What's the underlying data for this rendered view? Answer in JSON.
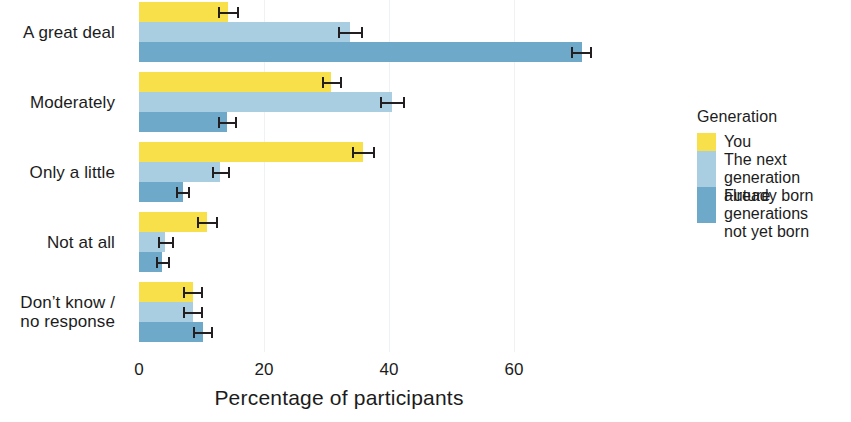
{
  "chart_data": {
    "type": "bar",
    "orientation": "horizontal",
    "title": "",
    "xlabel": "Percentage of participants",
    "ylabel": "",
    "xlim": [
      0,
      78
    ],
    "xticks": [
      0,
      20,
      40,
      60
    ],
    "xtick_labels": [
      "0",
      "20",
      "40",
      "60"
    ],
    "grid": true,
    "legend_position": "right",
    "legend_title": "Generation",
    "categories": [
      "A great deal",
      "Moderately",
      "Only a little",
      "Not at all",
      "Don’t know /\nno response"
    ],
    "series": [
      {
        "name": "You",
        "color": "#f7e04a",
        "values": [
          14.2,
          30.7,
          35.8,
          10.9,
          8.6
        ],
        "err_low": [
          12.6,
          29.3,
          34.0,
          9.2,
          7.1
        ],
        "err_high": [
          16.0,
          32.5,
          37.7,
          12.6,
          10.3
        ]
      },
      {
        "name": "The next generation\nalready born",
        "color": "#a9cde1",
        "values": [
          33.8,
          40.5,
          13.0,
          4.2,
          8.6
        ],
        "err_low": [
          31.9,
          38.6,
          11.6,
          3.0,
          7.1
        ],
        "err_high": [
          35.8,
          42.5,
          14.5,
          5.6,
          10.2
        ]
      },
      {
        "name": "Future generations\nnot yet born",
        "color": "#6ea9c9",
        "values": [
          70.8,
          14.1,
          7.0,
          3.7,
          10.2
        ],
        "err_low": [
          69.1,
          12.7,
          5.9,
          2.7,
          8.6
        ],
        "err_high": [
          72.5,
          15.6,
          8.2,
          4.9,
          11.8
        ]
      }
    ]
  },
  "axis": {
    "xlabel": "Percentage of participants"
  },
  "legend": {
    "title": "Generation",
    "items": [
      {
        "label": "You",
        "color": "#f7e04a"
      },
      {
        "label": "The next generation\nalready born",
        "color": "#a9cde1"
      },
      {
        "label": "Future generations\nnot yet born",
        "color": "#6ea9c9"
      }
    ]
  }
}
